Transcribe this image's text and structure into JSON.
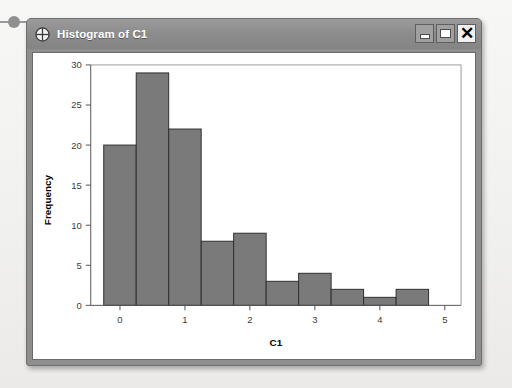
{
  "window": {
    "title": "Histogram of C1",
    "icon": "crosshair-globe-icon",
    "buttons": {
      "minimize_label": "",
      "maximize_label": "",
      "close_label": "✕"
    }
  },
  "chart_data": {
    "type": "bar",
    "title": "",
    "xlabel": "C1",
    "ylabel": "Frequency",
    "xlim": [
      -0.45,
      5.25
    ],
    "ylim": [
      0,
      30
    ],
    "grid": false,
    "legend": null,
    "bin_width": 0.5,
    "bin_starts": [
      -0.25,
      0.25,
      0.75,
      1.25,
      1.75,
      2.25,
      2.75,
      3.25,
      3.75,
      4.25
    ],
    "categories": [
      "-0.25–0.25",
      "0.25–0.75",
      "0.75–1.25",
      "1.25–1.75",
      "1.75–2.25",
      "2.25–2.75",
      "2.75–3.25",
      "3.25–3.75",
      "3.75–4.25",
      "4.25–4.75"
    ],
    "values": [
      20,
      29,
      22,
      8,
      9,
      3,
      4,
      2,
      1,
      2
    ],
    "xticks": [
      0,
      1,
      2,
      3,
      4,
      5
    ],
    "xticklabels": [
      "0",
      "1",
      "2",
      "3",
      "4",
      "5"
    ],
    "yticks": [
      0,
      5,
      10,
      15,
      20,
      25,
      30
    ],
    "yticklabels": [
      "0",
      "5",
      "10",
      "15",
      "20",
      "25",
      "30"
    ],
    "bar_color": "#7a7a7a",
    "bar_edge_color": "#2f2f2f"
  }
}
